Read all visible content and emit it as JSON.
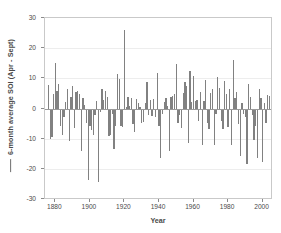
{
  "chart_data": {
    "type": "bar",
    "title": "",
    "subtitle": "",
    "xlabel": "Year",
    "ylabel": "6-month average SOI (Apr - Sept)",
    "ylabel_prefix_icon": "line-marker",
    "xlim": [
      1874,
      2006
    ],
    "ylim": [
      -30,
      30
    ],
    "grid": true,
    "grid_axis": "y",
    "legend": null,
    "legend_position": "none",
    "bar_color": "#818181",
    "zero_line_color": "#9a9a9a",
    "xticks": [
      1880,
      1900,
      1920,
      1940,
      1960,
      1980,
      2000
    ],
    "xtick_labels": [
      "1880",
      "1900",
      "1920",
      "1940",
      "1960",
      "1980",
      "2000"
    ],
    "yticks": [
      30,
      20,
      10,
      0,
      -10,
      -20,
      -30
    ],
    "ytick_labels": [
      "30",
      "20",
      "10",
      "0",
      "-10",
      "-20",
      "-30"
    ],
    "x": [
      1876,
      1877,
      1878,
      1879,
      1880,
      1881,
      1882,
      1883,
      1884,
      1885,
      1886,
      1887,
      1888,
      1889,
      1890,
      1891,
      1892,
      1893,
      1894,
      1895,
      1896,
      1897,
      1898,
      1899,
      1900,
      1901,
      1902,
      1903,
      1904,
      1905,
      1906,
      1907,
      1908,
      1909,
      1910,
      1911,
      1912,
      1913,
      1914,
      1915,
      1916,
      1917,
      1918,
      1919,
      1920,
      1921,
      1922,
      1923,
      1924,
      1925,
      1926,
      1927,
      1928,
      1929,
      1930,
      1931,
      1932,
      1933,
      1934,
      1935,
      1936,
      1937,
      1938,
      1939,
      1940,
      1941,
      1942,
      1943,
      1944,
      1945,
      1946,
      1947,
      1948,
      1949,
      1950,
      1951,
      1952,
      1953,
      1954,
      1955,
      1956,
      1957,
      1958,
      1959,
      1960,
      1961,
      1962,
      1963,
      1964,
      1965,
      1966,
      1967,
      1968,
      1969,
      1970,
      1971,
      1972,
      1973,
      1974,
      1975,
      1976,
      1977,
      1978,
      1979,
      1980,
      1981,
      1982,
      1983,
      1984,
      1985,
      1986,
      1987,
      1988,
      1989,
      1990,
      1991,
      1992,
      1993,
      1994,
      1995,
      1996,
      1997,
      1998,
      1999,
      2000,
      2001,
      2002,
      2003,
      2004
    ],
    "values": [
      7.8,
      -10.0,
      -9.2,
      5.0,
      15.3,
      6.0,
      8.2,
      -5.5,
      -8.5,
      -2.5,
      2.2,
      6.5,
      -10.5,
      4.0,
      7.5,
      -6.2,
      5.5,
      5.8,
      4.8,
      -13.8,
      3.5,
      1.2,
      -4.5,
      -23.5,
      -5.5,
      -6.8,
      -8.5,
      -2.0,
      2.8,
      -24.2,
      -1.0,
      6.5,
      3.0,
      6.0,
      4.0,
      -8.8,
      -8.5,
      -1.5,
      -13.2,
      -5.5,
      11.5,
      10.0,
      -5.5,
      -6.0,
      26.0,
      0.5,
      3.8,
      1.0,
      3.5,
      -4.8,
      -7.5,
      3.2,
      2.0,
      0.8,
      -4.5,
      -4.2,
      2.0,
      8.8,
      -2.0,
      3.0,
      -2.2,
      3.2,
      -2.5,
      12.0,
      -5.5,
      -16.0,
      -1.5,
      2.2,
      3.5,
      1.0,
      -13.8,
      3.8,
      4.2,
      5.0,
      14.8,
      -4.5,
      -2.0,
      -6.2,
      5.2,
      9.0,
      7.5,
      -11.2,
      12.5,
      2.2,
      11.0,
      2.5,
      3.0,
      -4.0,
      5.5,
      -12.0,
      2.8,
      9.5,
      -4.5,
      -6.5,
      5.2,
      6.5,
      -11.8,
      -1.5,
      10.5,
      7.0,
      -4.0,
      -6.5,
      9.2,
      5.0,
      -6.0,
      6.5,
      -12.0,
      16.2,
      3.5,
      5.5,
      -5.0,
      -15.5,
      2.0,
      -1.5,
      -2.5,
      -18.0,
      8.2,
      4.0,
      -2.0,
      -10.2,
      -5.5,
      -16.0,
      6.5,
      3.5,
      -17.5,
      2.0,
      -4.5,
      4.5,
      4.2
    ]
  }
}
